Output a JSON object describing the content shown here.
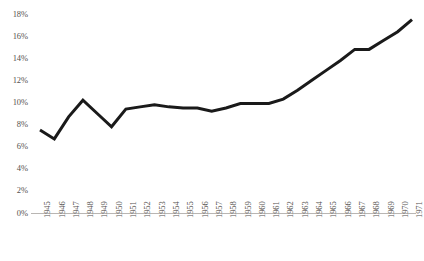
{
  "chart_data": {
    "type": "line",
    "title": "",
    "subtitle": "",
    "xlabel": "",
    "ylabel": "",
    "grid": false,
    "legend": false,
    "legend_position": "none",
    "line_color": "#1a1a1a",
    "axis_color": "#b9b6b3",
    "tick_label_color": "#55524f",
    "ylim": [
      0,
      18
    ],
    "ytick_values": [
      0,
      2,
      4,
      6,
      8,
      10,
      12,
      14,
      16,
      18
    ],
    "ytick_labels": [
      "0%",
      "2%",
      "4%",
      "6%",
      "8%",
      "10%",
      "12%",
      "14%",
      "16%",
      "18%"
    ],
    "xlim": [
      1945,
      1971
    ],
    "categories": [
      "1945",
      "1946",
      "1947",
      "1948",
      "1949",
      "1950",
      "1951",
      "1952",
      "1953",
      "1954",
      "1955",
      "1956",
      "1957",
      "1958",
      "1959",
      "1960",
      "1961",
      "1962",
      "1963",
      "1964",
      "1965",
      "1966",
      "1967",
      "1968",
      "1969",
      "1970",
      "1971"
    ],
    "values": [
      7.5,
      6.7,
      8.7,
      10.2,
      9.0,
      7.8,
      9.4,
      9.6,
      9.8,
      9.6,
      9.5,
      9.5,
      9.2,
      9.5,
      9.9,
      9.9,
      9.9,
      10.3,
      11.1,
      12.0,
      12.9,
      13.8,
      14.8,
      14.8,
      15.6,
      16.4,
      17.5
    ],
    "series": [
      {
        "name": "",
        "values": [
          7.5,
          6.7,
          8.7,
          10.2,
          9.0,
          7.8,
          9.4,
          9.6,
          9.8,
          9.6,
          9.5,
          9.5,
          9.2,
          9.5,
          9.9,
          9.9,
          9.9,
          10.3,
          11.1,
          12.0,
          12.9,
          13.8,
          14.8,
          14.8,
          15.6,
          16.4,
          17.5
        ]
      }
    ]
  }
}
